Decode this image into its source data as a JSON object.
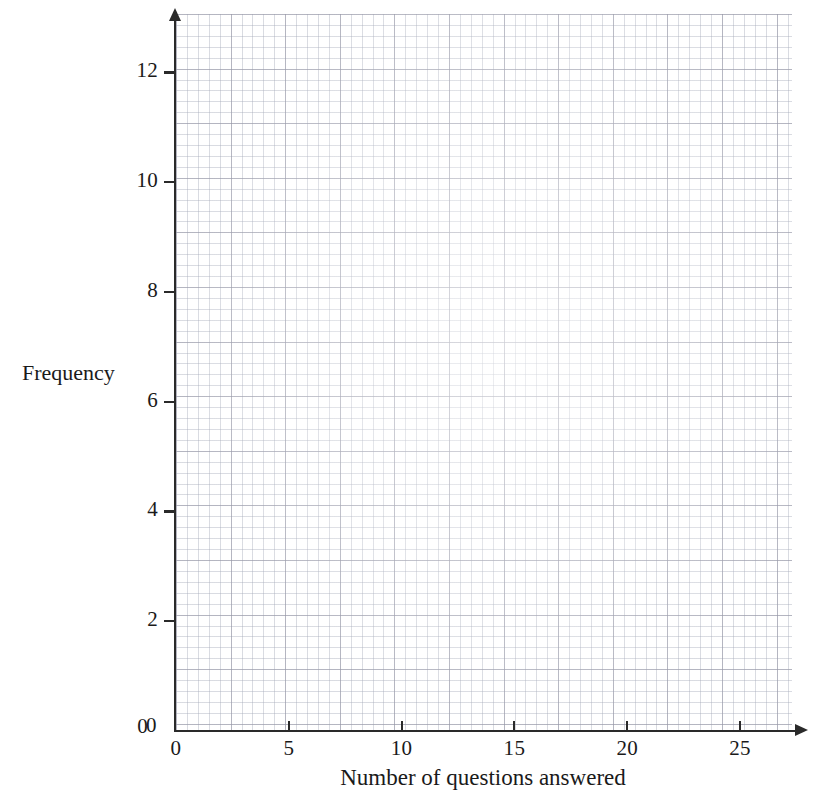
{
  "chart_data": {
    "type": "bar",
    "title": "",
    "subtitle": "",
    "xlabel": "Number of questions answered",
    "ylabel": "Frequency",
    "categories": [],
    "values": [],
    "series": [],
    "annotations": [],
    "legend": null,
    "legend_position": "none",
    "grid": true,
    "grid_style": "graph-paper",
    "grid_minor_units_per_major": 5,
    "xlim": [
      0,
      27.3
    ],
    "ylim": [
      0,
      13.1
    ],
    "xticks": [
      0,
      5,
      10,
      15,
      20,
      25
    ],
    "xtick_labels": [
      "0",
      "5",
      "10",
      "15",
      "20",
      "25"
    ],
    "yticks": [
      0,
      2,
      4,
      6,
      8,
      10,
      12
    ],
    "ytick_labels": [
      "0",
      "2",
      "4",
      "6",
      "8",
      "10",
      "12"
    ],
    "x_minor_step": 0.5,
    "y_minor_step": 0.2,
    "axis_arrows": true,
    "empty": true,
    "note": "Blank graph-paper axes; no data plotted."
  },
  "axes": {
    "y_title": "Frequency",
    "x_title": "Number of questions answered",
    "origin_label": "0",
    "y_ticks": [
      {
        "label": "12",
        "value": 12
      },
      {
        "label": "10",
        "value": 10
      },
      {
        "label": "8",
        "value": 8
      },
      {
        "label": "6",
        "value": 6
      },
      {
        "label": "4",
        "value": 4
      },
      {
        "label": "2",
        "value": 2
      },
      {
        "label": "0",
        "value": 0
      }
    ],
    "x_ticks": [
      {
        "label": "0",
        "value": 0
      },
      {
        "label": "5",
        "value": 5
      },
      {
        "label": "10",
        "value": 10
      },
      {
        "label": "15",
        "value": 15
      },
      {
        "label": "20",
        "value": 20
      },
      {
        "label": "25",
        "value": 25
      }
    ]
  },
  "colors": {
    "axis": "#2a2a2a",
    "text": "#1a1a1a",
    "grid_minor": "#a5aab9",
    "grid_major": "#9696a5",
    "paper": "#ffffff"
  }
}
